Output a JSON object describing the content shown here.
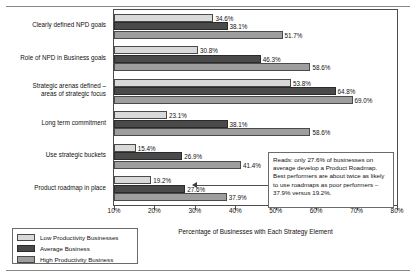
{
  "chart_data": {
    "type": "bar",
    "orientation": "horizontal",
    "title": "",
    "xlabel": "Percentage of Businesses with Each Strategy Element",
    "ylabel": "",
    "xlim": [
      10,
      80
    ],
    "xticks": [
      10,
      20,
      30,
      40,
      50,
      60,
      70,
      80
    ],
    "xtick_labels": [
      "10%",
      "20%",
      "30%",
      "40%",
      "50%",
      "60%",
      "70%",
      "80%"
    ],
    "grid": false,
    "legend_position": "below-left",
    "categories": [
      "Clearly defined NPD goals",
      "Role of NPD in Business goals",
      "Strategic arenas defined – areas of strategic focus",
      "Long term commitment",
      "Use strategic buckets",
      "Product roadmap in place"
    ],
    "series": [
      {
        "name": "Low Productivity Businesses",
        "color": "#d9d9d9",
        "values": [
          34.6,
          30.8,
          53.8,
          23.1,
          15.4,
          19.2
        ],
        "labels": [
          "34.6%",
          "30.8%",
          "53.8%",
          "23.1%",
          "15.4%",
          "19.2%"
        ]
      },
      {
        "name": "Average Business",
        "color": "#4a4a4a",
        "values": [
          38.1,
          46.3,
          64.8,
          38.1,
          26.9,
          27.6
        ],
        "labels": [
          "38.1%",
          "46.3%",
          "64.8%",
          "38.1%",
          "26.9%",
          "27.6%"
        ]
      },
      {
        "name": "High Productivity Business",
        "color": "#9e9e9e",
        "values": [
          51.7,
          58.6,
          69.0,
          58.6,
          41.4,
          37.9
        ],
        "labels": [
          "51.7%",
          "58.6%",
          "69.0%",
          "58.6%",
          "41.4%",
          "37.9%"
        ]
      }
    ],
    "annotations": [
      {
        "name": "product-roadmap-callout",
        "text": "Reads: only 27.6% of businesses on average develop a Product Roadmap. Best performers are about twice as likely to use roadmaps as poor performers – 37.9% versus 19.2%.",
        "points_to": "Product roadmap in place"
      }
    ]
  },
  "legend": {
    "items": [
      {
        "label": "Low Productivity Businesses",
        "swatch": "low"
      },
      {
        "label": "Average Business",
        "swatch": "avg"
      },
      {
        "label": "High Productivity Business",
        "swatch": "high"
      }
    ]
  }
}
